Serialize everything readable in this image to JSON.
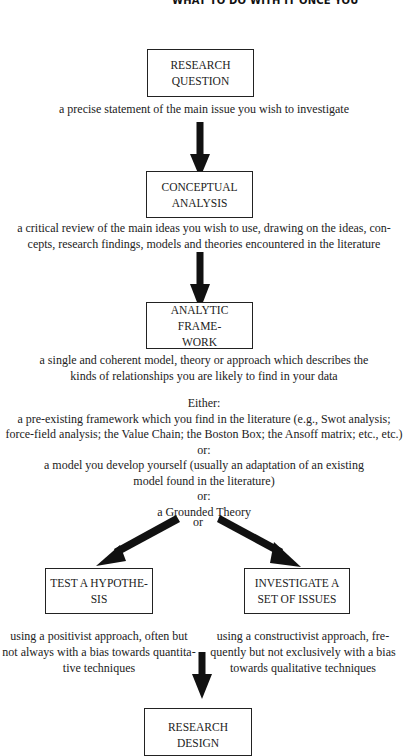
{
  "header": {
    "running_title": "WHAT TO DO WITH IT ONCE YOU'"
  },
  "flowchart": {
    "research_question": {
      "box_lines": [
        "RESEARCH",
        "QUESTION"
      ],
      "caption": [
        "a precise statement of the main issue you wish to investigate"
      ]
    },
    "conceptual_analysis": {
      "box_lines": [
        "CONCEPTUAL",
        "ANALYSIS"
      ],
      "caption": [
        "a critical review of the main ideas you wish to use, drawing on the ideas, con-",
        "cepts, research findings, models and theories encountered in the literature"
      ]
    },
    "analytic_framework": {
      "box_lines": [
        "ANALYTIC FRAME-",
        "WORK"
      ],
      "caption": [
        "a single and coherent model, theory or approach which describes the",
        "kinds of relationships you are likely to find in your data"
      ],
      "options_intro": "Either:",
      "option_1": [
        "a pre-existing framework which you find in the literature (e.g., Swot analysis;",
        "force-field analysis; the Value Chain; the Boston Box; the Ansoff matrix; etc., etc.)"
      ],
      "or_1": "or:",
      "option_2": [
        "a model you develop yourself (usually an adaptation of an existing",
        "model found in the literature)"
      ],
      "or_2": "or:",
      "option_3": [
        "a Grounded Theory"
      ]
    },
    "branch_label": "or",
    "test_hypothesis": {
      "box_lines": [
        "TEST A HYPOTHE-",
        "SIS"
      ],
      "caption": [
        "using a positivist approach, often but",
        "not always with a bias towards quantita-",
        "tive techniques"
      ]
    },
    "investigate_issues": {
      "box_lines": [
        "INVESTIGATE A",
        "SET OF ISSUES"
      ],
      "caption": [
        "using a constructivist approach, fre-",
        "quently but not exclusively with a bias",
        "towards qualitative techniques"
      ]
    },
    "research_design": {
      "box_lines": [
        "RESEARCH",
        "DESIGN"
      ]
    }
  },
  "colors": {
    "ink": "#1e1e1e",
    "background": "#ffffff"
  }
}
